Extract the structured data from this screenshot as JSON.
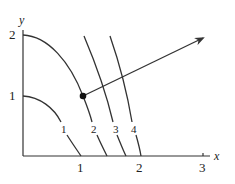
{
  "diagram": {
    "type": "level-curves-with-gradient",
    "axes": {
      "x_label": "x",
      "y_label": "y",
      "x_ticks": [
        "1",
        "2",
        "3"
      ],
      "y_ticks": [
        "1",
        "2"
      ]
    },
    "level_curves": [
      {
        "id": "c1",
        "label": "1"
      },
      {
        "id": "c2",
        "label": "2"
      },
      {
        "id": "c3",
        "label": "3"
      },
      {
        "id": "c4",
        "label": "4"
      }
    ],
    "point": {
      "description": "point on level curve 2"
    },
    "gradient_arrow": {
      "description": "vector pointing outward from point, perpendicular to level curves"
    },
    "colors": {
      "ink": "#333333",
      "background": "#ffffff"
    }
  }
}
